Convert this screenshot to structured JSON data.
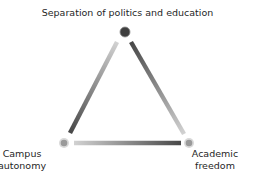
{
  "diagram": {
    "type": "triangle",
    "nodes": [
      {
        "id": "top",
        "label": "Separation of politics and education",
        "lines": [
          "Separation of politics and education"
        ],
        "color": "#3f3f3f",
        "ring": "#bdbdbd"
      },
      {
        "id": "left",
        "label": "Campus autonomy",
        "lines": [
          "Campus",
          "autonomy"
        ],
        "color": "#9a9a9a",
        "ring": "#d6d6d6"
      },
      {
        "id": "right",
        "label": "Academic freedom",
        "lines": [
          "Academic",
          "freedom"
        ],
        "color": "#9a9a9a",
        "ring": "#d6d6d6"
      }
    ],
    "edges": [
      {
        "from": "top",
        "to": "left",
        "gradient": [
          "#cfcfcf",
          "#4a4a4a"
        ],
        "note": "light near top, dark near Campus autonomy"
      },
      {
        "from": "top",
        "to": "right",
        "gradient": [
          "#4a4a4a",
          "#cfcfcf"
        ],
        "note": "dark near top, light near Academic freedom"
      },
      {
        "from": "left",
        "to": "right",
        "gradient": [
          "#cfcfcf",
          "#4a4a4a"
        ],
        "note": "light near Campus autonomy, dark near Academic freedom"
      }
    ]
  }
}
